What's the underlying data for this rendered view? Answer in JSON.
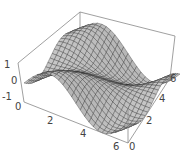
{
  "chart_data": {
    "type": "surface3d",
    "title": "",
    "function": "z = sin(x + y) (periodic wave surface)",
    "x": {
      "label": "",
      "range": [
        0,
        6.283
      ],
      "ticks": [
        "2",
        "4",
        "6"
      ]
    },
    "y": {
      "label": "",
      "range": [
        0,
        6.283
      ],
      "ticks": [
        "0",
        "2",
        "4",
        "6"
      ]
    },
    "z": {
      "label": "",
      "range": [
        -1,
        1
      ],
      "ticks": [
        "1",
        "0",
        "-1"
      ]
    },
    "x_origin_label": "0",
    "grid_lines": 24,
    "box": true,
    "colors": {
      "surface": "#bdbdbd",
      "mesh": "#2a2a2a",
      "box": "#777777"
    }
  }
}
